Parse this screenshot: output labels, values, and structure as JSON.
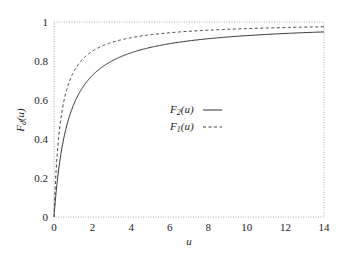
{
  "chart_data": {
    "type": "line",
    "title": "",
    "xlabel": "u",
    "ylabel": "F_d(u)",
    "xlim": [
      0,
      14
    ],
    "ylim": [
      0,
      1
    ],
    "xticks": [
      "0",
      "2",
      "4",
      "6",
      "8",
      "10",
      "12",
      "14"
    ],
    "yticks": [
      "0",
      "0.2",
      "0.4",
      "0.6",
      "0.8",
      "1"
    ],
    "grid": false,
    "legend_position": "center",
    "x": [
      0,
      0.25,
      0.5,
      1,
      1.5,
      2,
      3,
      4,
      5,
      6,
      8,
      10,
      12,
      14
    ],
    "series": [
      {
        "name": "F_2(u)",
        "style": "solid",
        "values": [
          0,
          0.24,
          0.38,
          0.56,
          0.65,
          0.71,
          0.79,
          0.83,
          0.86,
          0.88,
          0.91,
          0.93,
          0.94,
          0.95
        ]
      },
      {
        "name": "F_1(u)",
        "style": "dashed",
        "values": [
          0,
          0.42,
          0.59,
          0.74,
          0.81,
          0.85,
          0.9,
          0.92,
          0.93,
          0.94,
          0.96,
          0.97,
          0.97,
          0.975
        ]
      }
    ]
  },
  "legend": {
    "f2_main": "F",
    "f2_sub": "2",
    "f2_arg": "(u)",
    "f1_main": "F",
    "f1_sub": "1",
    "f1_arg": "(u)"
  },
  "axes": {
    "xlabel": "u",
    "ylabel_main": "F",
    "ylabel_sub": "d",
    "ylabel_arg": "(u)"
  }
}
